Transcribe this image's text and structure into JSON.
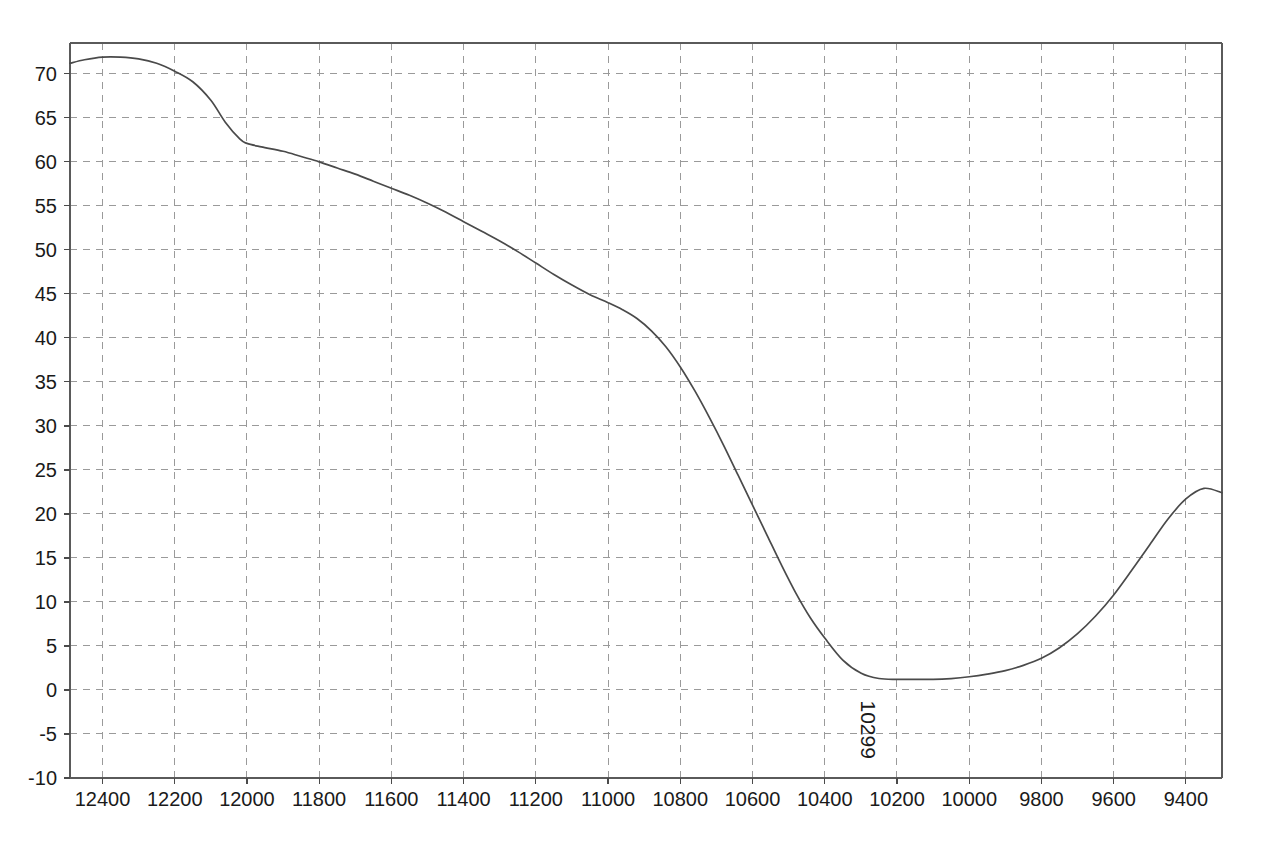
{
  "chart_data": {
    "type": "line",
    "title": "",
    "subtitle": "",
    "xlabel": "",
    "ylabel": "",
    "xlim": [
      12490,
      9300
    ],
    "ylim": [
      -10,
      73.5
    ],
    "x_reversed": true,
    "grid": true,
    "legend": null,
    "legend_position": "none",
    "x_ticks": [
      12400,
      12200,
      12000,
      11800,
      11600,
      11400,
      11200,
      11000,
      10800,
      10600,
      10400,
      10200,
      10000,
      9800,
      9600,
      9400
    ],
    "y_ticks": [
      -10,
      -5,
      0,
      5,
      10,
      15,
      20,
      25,
      30,
      35,
      40,
      45,
      50,
      55,
      60,
      65,
      70
    ],
    "y_minor_step": 5,
    "series": [
      {
        "name": "trace-1",
        "color": "#4a4a4a",
        "x": [
          12490,
          12450,
          12400,
          12350,
          12300,
          12250,
          12200,
          12150,
          12100,
          12060,
          12020,
          12000,
          11960,
          11900,
          11850,
          11800,
          11750,
          11700,
          11650,
          11600,
          11550,
          11500,
          11450,
          11400,
          11350,
          11300,
          11250,
          11200,
          11150,
          11100,
          11050,
          11000,
          10960,
          10920,
          10880,
          10840,
          10800,
          10760,
          10720,
          10680,
          10640,
          10600,
          10560,
          10520,
          10480,
          10440,
          10400,
          10350,
          10299,
          10250,
          10200,
          10150,
          10100,
          10050,
          10000,
          9950,
          9900,
          9850,
          9800,
          9750,
          9700,
          9650,
          9600,
          9550,
          9500,
          9450,
          9400,
          9350,
          9300
        ],
        "y": [
          71.2,
          71.6,
          71.9,
          71.9,
          71.7,
          71.2,
          70.3,
          69.1,
          67.0,
          64.5,
          62.6,
          62.1,
          61.7,
          61.2,
          60.6,
          60.0,
          59.3,
          58.6,
          57.8,
          57.0,
          56.2,
          55.3,
          54.3,
          53.2,
          52.1,
          51.0,
          49.8,
          48.5,
          47.2,
          46.0,
          44.9,
          44.0,
          43.2,
          42.2,
          40.8,
          39.0,
          36.7,
          34.0,
          31.0,
          27.8,
          24.4,
          21.0,
          17.6,
          14.2,
          11.0,
          8.2,
          5.9,
          3.4,
          1.9,
          1.3,
          1.2,
          1.2,
          1.2,
          1.3,
          1.5,
          1.8,
          2.2,
          2.8,
          3.6,
          4.8,
          6.4,
          8.4,
          10.8,
          13.6,
          16.5,
          19.4,
          21.7,
          22.9,
          22.4
        ]
      }
    ],
    "annotations": [
      {
        "text": "10299",
        "x": 10299,
        "y": -1.2,
        "rotation": 90,
        "name": "minimum-peak-label"
      }
    ]
  },
  "footer": {
    "text": "",
    "visible": false
  }
}
